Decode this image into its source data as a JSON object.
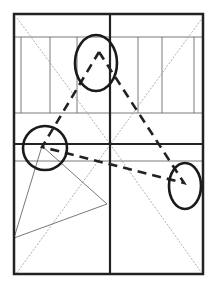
{
  "diagram": {
    "type": "composition-grid",
    "width": 214,
    "height": 291,
    "colors": {
      "background": "#ffffff",
      "frame": "#222222",
      "thin_line": "#7a7a7a",
      "diagonal": "#9a9a9a",
      "dashed": "#222222",
      "ellipse": "#1a1a1a"
    },
    "frame": {
      "x": 14,
      "y": 14,
      "w": 189,
      "h": 260
    },
    "thick_lines": [
      {
        "x1": 110,
        "y1": 14,
        "x2": 110,
        "y2": 274
      },
      {
        "x1": 14,
        "y1": 144,
        "x2": 203,
        "y2": 144
      }
    ],
    "thin_horizontal_lines": [
      {
        "y": 37
      },
      {
        "y": 113
      },
      {
        "y": 161
      }
    ],
    "thin_vertical_lines": [
      {
        "x": 21
      },
      {
        "x": 50
      },
      {
        "x": 77
      },
      {
        "x": 138
      },
      {
        "x": 162
      },
      {
        "x": 194
      }
    ],
    "diagonals": [
      {
        "x1": 17,
        "y1": 18,
        "x2": 110,
        "y2": 144
      },
      {
        "x1": 203,
        "y1": 17,
        "x2": 16,
        "y2": 274
      },
      {
        "x1": 110,
        "y1": 144,
        "x2": 201,
        "y2": 272
      }
    ],
    "thin_triangle": [
      {
        "x": 42,
        "y": 146
      },
      {
        "x": 107,
        "y": 204
      },
      {
        "x": 14,
        "y": 238
      }
    ],
    "dashed_path": [
      {
        "x": 99,
        "y": 52
      },
      {
        "x": 184,
        "y": 183
      },
      {
        "x": 42,
        "y": 147
      },
      {
        "x": 99,
        "y": 52
      }
    ],
    "ellipses": [
      {
        "name": "top-ellipse",
        "cx": 96,
        "cy": 63,
        "rx": 21,
        "ry": 28
      },
      {
        "name": "left-circle",
        "cx": 45,
        "cy": 148,
        "rx": 22,
        "ry": 22
      },
      {
        "name": "right-ellipse",
        "cx": 185,
        "cy": 186,
        "rx": 16,
        "ry": 23
      }
    ]
  }
}
